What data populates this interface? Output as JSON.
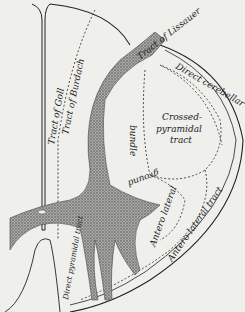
{
  "diagram": {
    "type": "anatomical cross-section",
    "labels": {
      "lissauer": "Tract of Lissauer",
      "direct_cerebellar": "Direct cerebellar tract",
      "goll": "Tract of Goll",
      "burdach": "Tract of Burdach",
      "crossed_pyramidal_1": "Crossed-",
      "crossed_pyramidal_2": "pyramidal",
      "crossed_pyramidal_3": "tract",
      "ground_bundle_1": "bundle",
      "ground_bundle_2": "ground",
      "antero_lateral_short": "Antero lateral",
      "antero_lateral_tract": "Antero-lateral tract",
      "direct_pyramidal": "Direct pyramidal tract"
    },
    "colors": {
      "background": "#efefeb",
      "line": "#222222",
      "grey_matter": "#8a8a86"
    }
  }
}
